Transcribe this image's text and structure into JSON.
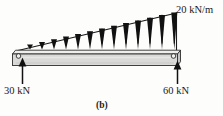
{
  "figure": {
    "caption": "(b)",
    "type": "beam-load-diagram"
  },
  "labels": {
    "distributed_load": "20 kN/m",
    "left_reaction": "30 kN",
    "right_reaction": "60 kN"
  },
  "diagram_data": {
    "beam": {
      "left_x": 12,
      "right_x": 180,
      "top_y": 50,
      "bottom_y": 66,
      "top_face_color": "#e8e8e6",
      "front_face_color": "#d4d4d2",
      "outline_color": "#3a3a3a"
    },
    "distributed_load": {
      "shape": "triangular",
      "intensity_left": "0",
      "intensity_right": "20 kN/m",
      "apex_x": 18,
      "apex_y": 50,
      "peak_x": 176,
      "peak_y": 13,
      "arrow_count": 13,
      "arrow_color": "#111111"
    },
    "supports": [
      {
        "name": "left-pin",
        "x": 18,
        "y": 56,
        "reaction": "30 kN",
        "direction": "up"
      },
      {
        "name": "right-pin",
        "x": 174,
        "y": 56,
        "reaction": "60 kN",
        "direction": "up"
      }
    ],
    "reactions": [
      {
        "label": "30 kN",
        "x": 22,
        "tail_y": 84,
        "head_y": 60
      },
      {
        "label": "60 kN",
        "x": 177,
        "tail_y": 84,
        "head_y": 62
      }
    ]
  }
}
